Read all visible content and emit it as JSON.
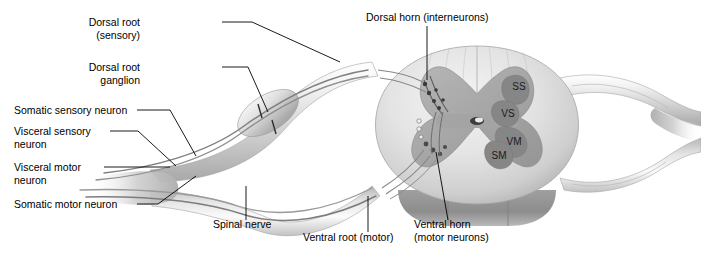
{
  "figure": {
    "background_color": "#ffffff",
    "ink_color": "#000000",
    "palette": {
      "white_matter_light": "#e9e9e9",
      "white_matter_mid": "#d2d2d2",
      "gray_matter": "#a9a9a9",
      "gray_matter_dark": "#8e8e8e",
      "nucleus_fill": "#8a8a8a",
      "nerve_light": "#efefef",
      "nerve_mid": "#c9c9c9",
      "nerve_dark": "#9a9a9a",
      "fiber_stroke": "#6f6f6f"
    }
  },
  "labels": {
    "dorsal_root_line1": "Dorsal root",
    "dorsal_root_line2": "(sensory)",
    "dorsal_root_ganglion_line1": "Dorsal root",
    "dorsal_root_ganglion_line2": "ganglion",
    "somatic_sensory_neuron": "Somatic sensory neuron",
    "visceral_sensory_line1": "Visceral sensory",
    "visceral_sensory_line2": "neuron",
    "visceral_motor_line1": "Visceral motor",
    "visceral_motor_line2": "neuron",
    "somatic_motor_neuron": "Somatic motor neuron",
    "dorsal_horn": "Dorsal horn (interneurons)",
    "spinal_nerve": "Spinal nerve",
    "ventral_root": "Ventral root (motor)",
    "ventral_horn_line1": "Ventral horn",
    "ventral_horn_line2": "(motor neurons)"
  },
  "gray_matter_nuclei": [
    {
      "code": "SS",
      "name": "somatic-sensory-nucleus"
    },
    {
      "code": "VS",
      "name": "visceral-sensory-nucleus"
    },
    {
      "code": "VM",
      "name": "visceral-motor-nucleus"
    },
    {
      "code": "SM",
      "name": "somatic-motor-nucleus"
    }
  ]
}
